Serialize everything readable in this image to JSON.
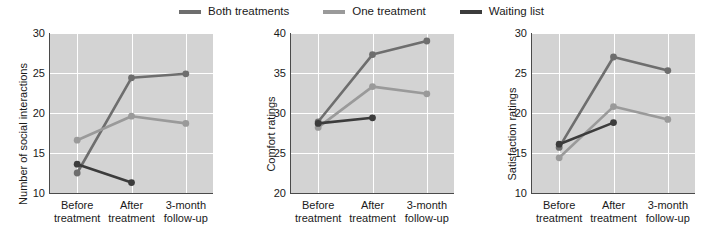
{
  "legend": {
    "position": "top-center",
    "entries": [
      {
        "label": "Both treatments",
        "color": "#6e6e6e",
        "icon": "line-swatch-icon"
      },
      {
        "label": "One treatment",
        "color": "#9a9a9a",
        "icon": "line-swatch-icon"
      },
      {
        "label": "Waiting list",
        "color": "#3c3c3c",
        "icon": "line-swatch-icon"
      }
    ]
  },
  "colors": {
    "both_treatments": "#6e6e6e",
    "one_treatment": "#9a9a9a",
    "waiting_list": "#3c3c3c",
    "plot_background": "#d3d3d3",
    "grid": "#ffffff",
    "axis": "#4a4a4a",
    "text": "#1a1a1a"
  },
  "chart_data": [
    {
      "type": "line",
      "title": "",
      "xlabel": "",
      "ylabel": "Number of social interactions",
      "categories": [
        "Before treatment",
        "After treatment",
        "3-month follow-up"
      ],
      "category_lines": [
        [
          "Before",
          "treatment"
        ],
        [
          "After",
          "treatment"
        ],
        [
          "3-month",
          "follow-up"
        ]
      ],
      "ylim": [
        10,
        30
      ],
      "yticks": [
        10,
        15,
        20,
        25,
        30
      ],
      "grid": true,
      "series": [
        {
          "name": "Both treatments",
          "color": "#6e6e6e",
          "values": [
            12.5,
            24.4,
            24.9
          ]
        },
        {
          "name": "One treatment",
          "color": "#9a9a9a",
          "values": [
            16.6,
            19.6,
            18.7
          ]
        },
        {
          "name": "Waiting list",
          "color": "#3c3c3c",
          "values": [
            13.6,
            11.3,
            null
          ]
        }
      ]
    },
    {
      "type": "line",
      "title": "",
      "xlabel": "",
      "ylabel": "Comfort ratings",
      "categories": [
        "Before treatment",
        "After treatment",
        "3-month follow-up"
      ],
      "category_lines": [
        [
          "Before",
          "treatment"
        ],
        [
          "After",
          "treatment"
        ],
        [
          "3-month",
          "follow-up"
        ]
      ],
      "ylim": [
        20,
        40
      ],
      "yticks": [
        20,
        25,
        30,
        35,
        40
      ],
      "grid": true,
      "series": [
        {
          "name": "Both treatments",
          "color": "#6e6e6e",
          "values": [
            28.9,
            37.3,
            39.0
          ]
        },
        {
          "name": "One treatment",
          "color": "#9a9a9a",
          "values": [
            28.2,
            33.3,
            32.4
          ]
        },
        {
          "name": "Waiting list",
          "color": "#3c3c3c",
          "values": [
            28.7,
            29.4,
            null
          ]
        }
      ]
    },
    {
      "type": "line",
      "title": "",
      "xlabel": "",
      "ylabel": "Satisfaction ratings",
      "categories": [
        "Before treatment",
        "After treatment",
        "3-month follow-up"
      ],
      "category_lines": [
        [
          "Before",
          "treatment"
        ],
        [
          "After",
          "treatment"
        ],
        [
          "3-month",
          "follow-up"
        ]
      ],
      "ylim": [
        10,
        30
      ],
      "yticks": [
        10,
        15,
        20,
        25,
        30
      ],
      "grid": true,
      "series": [
        {
          "name": "Both treatments",
          "color": "#6e6e6e",
          "values": [
            15.7,
            27.0,
            25.3
          ]
        },
        {
          "name": "One treatment",
          "color": "#9a9a9a",
          "values": [
            14.4,
            20.8,
            19.2
          ]
        },
        {
          "name": "Waiting list",
          "color": "#3c3c3c",
          "values": [
            16.1,
            18.8,
            null
          ]
        }
      ]
    }
  ]
}
